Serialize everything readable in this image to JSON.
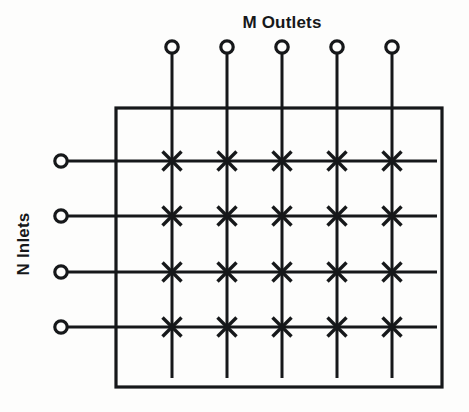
{
  "figure": {
    "name": "crossbar-switch-matrix",
    "title_top": "M Outlets",
    "label_left": "N Inlets",
    "background_color": "#fdfdfc",
    "ink_color": "#16181a"
  },
  "geometry": {
    "canvas": {
      "width": 469,
      "height": 412
    },
    "enclosure": {
      "x": 116,
      "y": 108,
      "width": 326,
      "height": 279,
      "stroke_width": 3.2
    },
    "outlet_circle_y": 47,
    "outlet_circle_r": 6.2,
    "inlet_circle_x": 61,
    "inlet_circle_r": 6.2,
    "column_x": [
      172,
      227,
      282,
      337,
      392
    ],
    "row_y": [
      161,
      216,
      272,
      327
    ],
    "vertical_line_top": 53,
    "vertical_line_bottom": 378,
    "horizontal_line_left": 68,
    "horizontal_line_right": 437,
    "line_stroke_width": 3.0,
    "crosspoint_arm": 9.5
  },
  "labels": {
    "top": {
      "text": "M Outlets",
      "x": 282,
      "y": 28,
      "anchor": "middle",
      "font_size": 17
    },
    "left": {
      "text": "N Inlets",
      "x": 29,
      "y": 244,
      "rotation": -90,
      "anchor": "middle",
      "font_size": 17
    }
  },
  "counts": {
    "outlets": 5,
    "inlets": 4,
    "crosspoints": 20
  },
  "chart_data": {
    "type": "diagram",
    "subtype": "crossbar-switch-matrix",
    "title": "M Outlets",
    "xlabel": "M Outlets",
    "ylabel": "N Inlets",
    "columns": 5,
    "rows": 4,
    "column_labels": [
      "outlet-1",
      "outlet-2",
      "outlet-3",
      "outlet-4",
      "outlet-5"
    ],
    "row_labels": [
      "inlet-1",
      "inlet-2",
      "inlet-3",
      "inlet-4"
    ],
    "crosspoint_symbol": "X",
    "crosspoint_count": 20,
    "terminal_symbol": "open-circle"
  }
}
